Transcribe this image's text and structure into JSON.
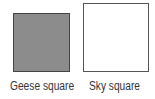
{
  "squares": [
    {
      "label": "Geese square",
      "fill": "#8c8c8c"
    },
    {
      "label": "Sky square",
      "fill": "#ffffff"
    }
  ]
}
